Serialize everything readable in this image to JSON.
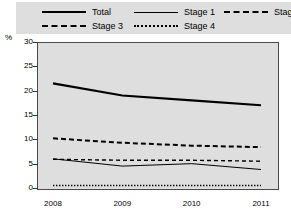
{
  "chart_data": {
    "type": "line",
    "title": "",
    "xlabel": "",
    "ylabel": "%",
    "categories": [
      "2008",
      "2009",
      "2010",
      "2011"
    ],
    "x": [
      2008,
      2009,
      2010,
      2011
    ],
    "ylim": [
      0,
      30
    ],
    "yticks": [
      0,
      5,
      10,
      15,
      20,
      25,
      30
    ],
    "grid": false,
    "legend_position": "top",
    "series": [
      {
        "name": "Total",
        "style": "solid-thick",
        "values": [
          21.5,
          19.0,
          18.0,
          17.0
        ]
      },
      {
        "name": "Stage 1",
        "style": "solid-thin",
        "values": [
          6.0,
          4.5,
          5.0,
          3.8
        ]
      },
      {
        "name": "Stage 2",
        "style": "dashed",
        "values": [
          10.2,
          9.3,
          8.7,
          8.4
        ]
      },
      {
        "name": "Stage 3",
        "style": "dashed-thin",
        "values": [
          5.9,
          5.7,
          5.7,
          5.5
        ]
      },
      {
        "name": "Stage 4",
        "style": "dotted",
        "values": [
          0.5,
          0.5,
          0.5,
          0.5
        ]
      }
    ]
  },
  "legend": {
    "items": [
      {
        "label": "Total",
        "swatch": "solid-thick-line-icon"
      },
      {
        "label": "Stage 1",
        "swatch": "solid-thin-line-icon"
      },
      {
        "label": "Stage 2",
        "swatch": "dashed-line-icon"
      },
      {
        "label": "Stage 3",
        "swatch": "dashed-thin-line-icon"
      },
      {
        "label": "Stage 4",
        "swatch": "dotted-line-icon"
      }
    ]
  },
  "axes": {
    "y_unit": "%",
    "y_ticks": [
      "30",
      "25",
      "20",
      "15",
      "10",
      "5",
      "0"
    ],
    "x_ticks": [
      "2008",
      "2009",
      "2010",
      "2011"
    ]
  },
  "colors": {
    "line": "#000000",
    "plot_background": "#dedede",
    "legend_background": "#dedede",
    "axis": "#4a4a4a"
  }
}
